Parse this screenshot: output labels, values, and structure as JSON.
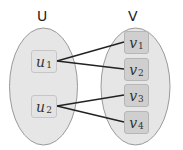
{
  "diagram": {
    "type": "bipartite-graph",
    "sets": [
      {
        "id": "U",
        "label": "U",
        "nodes": [
          {
            "id": "u1",
            "base": "u",
            "sub": "1"
          },
          {
            "id": "u2",
            "base": "u",
            "sub": "2"
          }
        ]
      },
      {
        "id": "V",
        "label": "V",
        "nodes": [
          {
            "id": "v1",
            "base": "v",
            "sub": "1"
          },
          {
            "id": "v2",
            "base": "v",
            "sub": "2"
          },
          {
            "id": "v3",
            "base": "v",
            "sub": "3"
          },
          {
            "id": "v4",
            "base": "v",
            "sub": "4"
          }
        ]
      }
    ],
    "edges": [
      {
        "from": "u1",
        "to": "v1"
      },
      {
        "from": "u1",
        "to": "v2"
      },
      {
        "from": "u2",
        "to": "v3"
      },
      {
        "from": "u2",
        "to": "v4"
      }
    ],
    "colors": {
      "ellipse_fill": "#e6e6e6",
      "ellipse_stroke": "#9a9a9a",
      "u_node_fill": "#e3e3e3",
      "v_node_fill": "#cfcfcf",
      "edge": "#222222"
    }
  }
}
